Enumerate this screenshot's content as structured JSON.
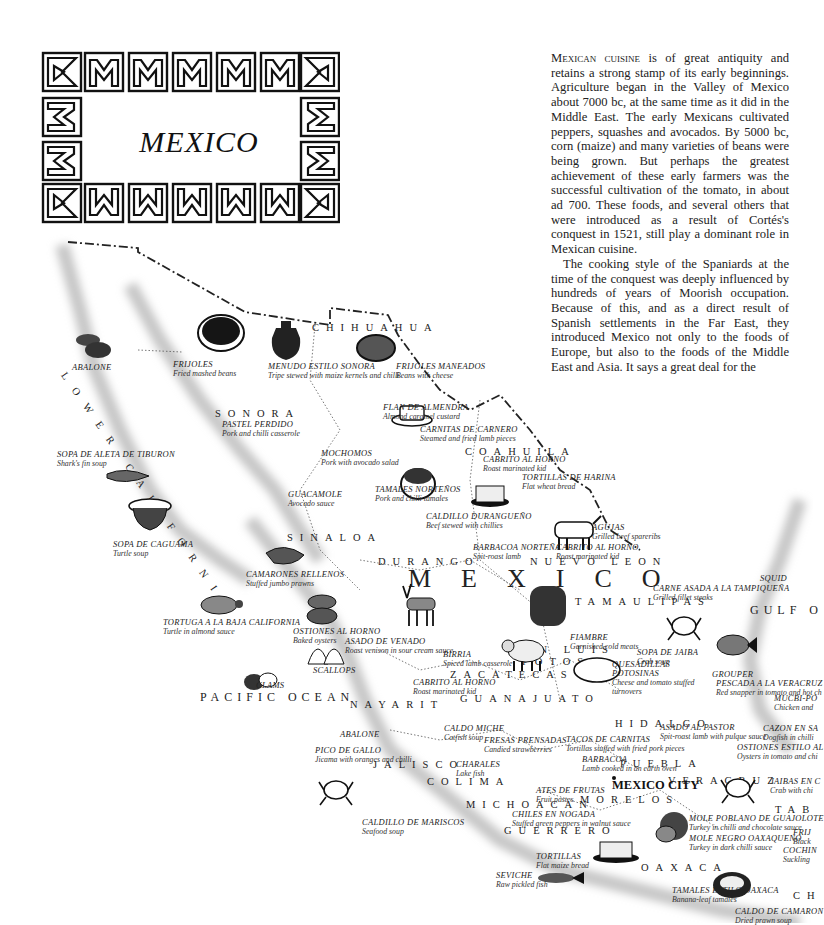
{
  "title": "MEXICO",
  "intro": {
    "lead_smallcaps": "Mexican cuisine",
    "paragraph1_rest": " is of great antiquity and retains a strong stamp of its early beginnings. Agriculture began in the Valley of Mexico about 7000 bc, at the same time as it did in the Middle East. The early Mexicans cultivated peppers, squashes and avocados. By 5000 bc, corn (maize) and many varieties of beans were being grown. But perhaps the greatest achievement of these early farmers was the successful cultivation of the tomato, in about ad 700. These foods, and several others that were introduced as a result of Cortés's conquest in 1521, still play a dominant role in Mexican cuisine.",
    "paragraph2": "The cooking style of the Spaniards at the time of the conquest was deeply influenced by hundreds of years of Moorish occupation. Because of this, and as a direct result of Spanish settlements in the Far East, they introduced Mexico not only to the foods of Europe, but also to the foods of the Middle East and Asia. It says a great deal for the"
  },
  "map": {
    "country_label": "MEXICO",
    "capital": "MEXICO CITY",
    "seas": [
      "PACIFIC OCEAN",
      "GULF O"
    ],
    "regions": [
      "LOWER CALIFORNIA",
      "CHIHUAHUA",
      "SONORA",
      "COAHUILA",
      "SINALOA",
      "DURANGO",
      "NUEVO LEON",
      "TAMAULIPAS",
      "SAN LUIS",
      "POTOSI",
      "ZACATECAS",
      "NAYARIT",
      "GUANAJUATO",
      "HIDALGO",
      "JALISCO",
      "COLIMA",
      "MICHOACAN",
      "MORELOS",
      "PUEBLA",
      "VERACRUZ",
      "GUERRERO",
      "OAXACA",
      "TAB",
      "CH"
    ],
    "dishes": [
      {
        "name": "ABALONE",
        "desc": ""
      },
      {
        "name": "FRIJOLES",
        "desc": "Fried mashed beans"
      },
      {
        "name": "MENUDO ESTILO SONORA",
        "desc": "Tripe stewed with maize kernels and chilli"
      },
      {
        "name": "FRIJOLES MANEADOS",
        "desc": "Beans with cheese"
      },
      {
        "name": "FLAN DE ALMENDRA",
        "desc": "Almond caramel custard"
      },
      {
        "name": "PASTEL PERDIDO",
        "desc": "Pork and chilli casserole"
      },
      {
        "name": "CARNITAS DE CARNERO",
        "desc": "Steamed and fried lamb pieces"
      },
      {
        "name": "SOPA DE ALETA DE TIBURON",
        "desc": "Shark's fin soup"
      },
      {
        "name": "MOCHOMOS",
        "desc": "Pork with avocado salad"
      },
      {
        "name": "CABRITO AL HORNO",
        "desc": "Roast marinated kid"
      },
      {
        "name": "TORTILLAS DE HARINA",
        "desc": "Flat wheat bread"
      },
      {
        "name": "GUACAMOLE",
        "desc": "Avocado sauce"
      },
      {
        "name": "TAMALES NORTEÑOS",
        "desc": "Pork and chilli tamales"
      },
      {
        "name": "CALDILLO DURANGUEÑO",
        "desc": "Beef stewed with chillies"
      },
      {
        "name": "AGUJAS",
        "desc": "Grilled beef spareribs"
      },
      {
        "name": "SOPA DE CAGUAMA",
        "desc": "Turtle soup"
      },
      {
        "name": "BARBACOA NORTEÑA",
        "desc": "Spit-roast lamb"
      },
      {
        "name": "CABRITO AL HORNO",
        "desc": "Roast marinated kid"
      },
      {
        "name": "CAMARONES RELLENOS",
        "desc": "Stuffed jumbo prawns"
      },
      {
        "name": "SQUID",
        "desc": ""
      },
      {
        "name": "CARNE ASADA A LA TAMPIQUEÑA",
        "desc": "Grilled fillet steaks"
      },
      {
        "name": "TORTUGA A LA BAJA CALIFORNIA",
        "desc": "Turtle in almond sauce"
      },
      {
        "name": "OSTIONES AL HORNO",
        "desc": "Baked oysters"
      },
      {
        "name": "ASADO DE VENADO",
        "desc": "Roast venison in sour cream sauce"
      },
      {
        "name": "FIAMBRE",
        "desc": "Garnished cold meats"
      },
      {
        "name": "BIRRIA",
        "desc": "Spiced lamb casserole"
      },
      {
        "name": "SOPA DE JAIBA",
        "desc": "Crab soup"
      },
      {
        "name": "QUESADILLAS POTOSINAS",
        "desc": "Cheese and tomato stuffed turnovers"
      },
      {
        "name": "SCALLOPS",
        "desc": ""
      },
      {
        "name": "CABRITO AL HORNO",
        "desc": "Roast marinated kid"
      },
      {
        "name": "GROUPER",
        "desc": ""
      },
      {
        "name": "PESCADA A LA VERACRUZ",
        "desc": "Red snapper in tomato and hot ch"
      },
      {
        "name": "CLAMS",
        "desc": ""
      },
      {
        "name": "MUCBI-PO",
        "desc": "Chicken and"
      },
      {
        "name": "ABALONE",
        "desc": ""
      },
      {
        "name": "CALDO MICHE",
        "desc": "Catfish soup"
      },
      {
        "name": "ASADO AL PASTOR",
        "desc": "Spit-roast lamb with pulque sauce"
      },
      {
        "name": "CAZON EN SA",
        "desc": "Dogfish in chilli"
      },
      {
        "name": "FRESAS PRENSADAS",
        "desc": "Candied strawberries"
      },
      {
        "name": "TACOS DE CARNITAS",
        "desc": "Tortillas stuffed with fried pork pieces"
      },
      {
        "name": "PICO DE GALLO",
        "desc": "Jicama with oranges and chilli"
      },
      {
        "name": "OSTIONES ESTILO AL",
        "desc": "Oysters in tomato and chi"
      },
      {
        "name": "BARBACOA",
        "desc": "Lamb cooked in an earth oven"
      },
      {
        "name": "CHARALES",
        "desc": "Lake fish"
      },
      {
        "name": "JAIBAS EN C",
        "desc": "Crab with chi"
      },
      {
        "name": "ATES DE FRUTAS",
        "desc": "Fruit pastes"
      },
      {
        "name": "CHILES EN NOGADA",
        "desc": "Stuffed green peppers in walnut sauce"
      },
      {
        "name": "MOLE POBLANO DE GUAJOLOTE",
        "desc": "Turkey in chilli and chocolate sauce"
      },
      {
        "name": "FRIJ",
        "desc": "Black"
      },
      {
        "name": "MOLE NEGRO OAXAQUENO",
        "desc": "Turkey in dark chilli sauce"
      },
      {
        "name": "COCHIN",
        "desc": "Suckling"
      },
      {
        "name": "CALDILLO DE MARISCOS",
        "desc": "Seafood soup"
      },
      {
        "name": "TORTILLAS",
        "desc": "Flat maize bread"
      },
      {
        "name": "SEVICHE",
        "desc": "Raw pickled fish"
      },
      {
        "name": "TAMALES ESTILO OAXACA",
        "desc": "Banana-leaf tamales"
      },
      {
        "name": "CALDO DE CAMARON",
        "desc": "Dried prawn soup"
      }
    ]
  },
  "colors": {
    "ink": "#1a1a1a",
    "shadow": "#c8c8c8",
    "paper": "#ffffff"
  }
}
